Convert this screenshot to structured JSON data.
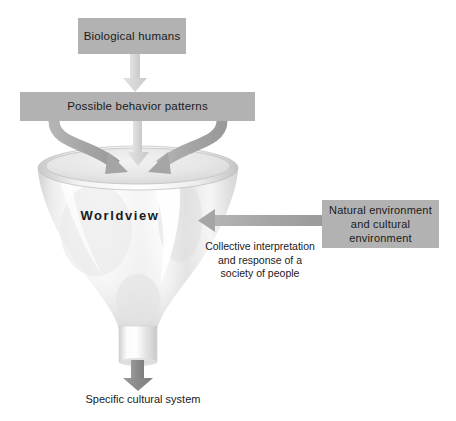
{
  "diagram": {
    "colors": {
      "box_fill": "#b2b2b2",
      "text": "#1b1b1b",
      "arrow_light": "#d9d9d9",
      "arrow_mid": "#a8a8a8",
      "arrow_dark": "#8a8a8a",
      "funnel_light": "#ffffff",
      "funnel_shade": "#dcdcdc",
      "background": "#ffffff"
    },
    "boxes": {
      "biological": {
        "label": "Biological humans"
      },
      "behavior": {
        "label": "Possible behavior patterns"
      },
      "environment": {
        "line1": "Natural environment",
        "line2": "and",
        "line3": "cultural environment"
      }
    },
    "labels": {
      "worldview": "Worldview",
      "collective": {
        "line1": "Collective interpretation",
        "line2": "and response of a",
        "line3": "society of people"
      },
      "output": "Specific cultural system"
    },
    "arrows": [
      {
        "name": "biological-to-behavior",
        "direction": "down",
        "shade": "light"
      },
      {
        "name": "behavior-center-into-funnel",
        "direction": "down",
        "shade": "light"
      },
      {
        "name": "behavior-left-curve-into-funnel",
        "direction": "curve-down-right",
        "shade": "mid"
      },
      {
        "name": "behavior-right-curve-into-funnel",
        "direction": "curve-down-left",
        "shade": "mid"
      },
      {
        "name": "environment-into-funnel",
        "direction": "left",
        "shade": "mid"
      },
      {
        "name": "funnel-to-output",
        "direction": "down",
        "shade": "dark"
      }
    ]
  }
}
